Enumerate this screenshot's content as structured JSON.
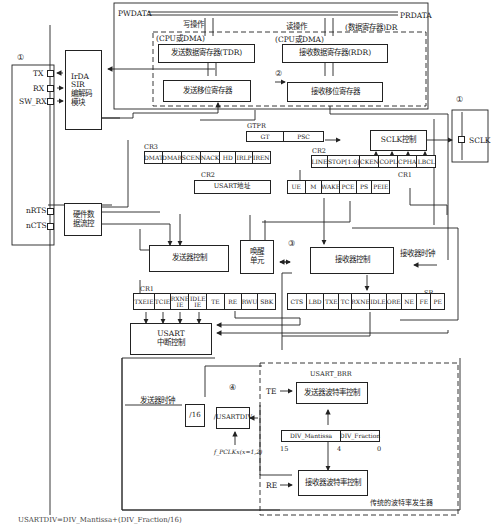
{
  "diagram": {
    "bus": {
      "pwdata": "PWDATA",
      "prdata": "PRDATA",
      "write_op": "写操作",
      "read_op": "读操作",
      "dr_label": "(数据寄存器)DR",
      "cpu_dma_tx": "(CPU或DMA)",
      "cpu_dma_rx": "(CPU或DMA)"
    },
    "markers": {
      "m1_left": "①",
      "m1_right": "①",
      "m2": "②",
      "m3": "③",
      "m4": "④"
    },
    "pins_left": [
      {
        "name": "TX"
      },
      {
        "name": "RX"
      },
      {
        "name": "SW_RX"
      },
      {
        "name": "nRTS"
      },
      {
        "name": "nCTS"
      }
    ],
    "pins_right": [
      {
        "name": "SCLK"
      }
    ],
    "blocks": {
      "irda": "IrDA\nSIR\n编解码\n模块",
      "tdr": "发送数据寄存器(TDR)",
      "rdr": "接收数据寄存器(RDR)",
      "tx_shift": "发送移位寄存器",
      "rx_shift": "接收移位寄存器",
      "sclk_ctrl": "SCLK控制",
      "hw_flow": "硬件数\n据流控",
      "tx_ctrl": "发送器控制",
      "wakeup": "唤醒\n单元",
      "rx_ctrl": "接收器控制",
      "usart_irq": "USART\n中断控制",
      "div16": "/16",
      "usartdiv": "/USARTDIV",
      "tx_baud": "发送器波特率控制",
      "rx_baud": "接收器波特率控制",
      "usart_addr": "USART地址"
    },
    "registers": {
      "gtpr": {
        "label": "GTPR",
        "cells": [
          "GT",
          "PSC"
        ]
      },
      "cr3": {
        "label": "CR3",
        "cells": [
          "DMAT",
          "DMAR",
          "SCEN",
          "NACK",
          "HD",
          "IRLP",
          "IREN"
        ]
      },
      "cr2_top": {
        "label": "CR2",
        "cells": [
          "LINE",
          "STOP[1:0]",
          "CKEN",
          "COPL",
          "CPHA",
          "LBCL"
        ]
      },
      "cr2_addr": {
        "label": "CR2"
      },
      "cr1_top": {
        "label": "CR1",
        "cells": [
          "UE",
          "M",
          "WAKE",
          "PCE",
          "PS",
          "PEIE"
        ]
      },
      "cr1_bottom": {
        "label": "CR1",
        "cells": [
          "TXEIE",
          "TCIE",
          "RXNE\nIE",
          "IDLE\nIE",
          "TE",
          "RE",
          "RWU",
          "SBK"
        ]
      },
      "sr": {
        "label": "SR",
        "cells": [
          "CTS",
          "LBD",
          "TXE",
          "TC",
          "RXNE",
          "IDLE",
          "ORE",
          "NE",
          "FE",
          "PE"
        ]
      },
      "brr": {
        "label": "USART_BRR",
        "cells": [
          "DIV_Mantissa",
          "DIV_Fraction"
        ],
        "bits": [
          "15",
          "4",
          "0"
        ]
      }
    },
    "signals": {
      "rx_clock": "接收器时钟",
      "tx_clock": "发送器时钟",
      "te": "TE",
      "re": "RE",
      "fpclk": "f_PCLKx(x=1,2)",
      "baud_gen": "传统的波特率发生器"
    },
    "caption": "USARTDIV=DIV_Mantissa+(DIV_Fraction/16)"
  }
}
